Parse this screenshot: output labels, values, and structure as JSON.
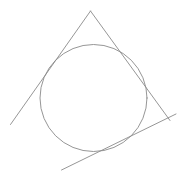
{
  "document": {
    "kind": "geometry-figure",
    "title": "Circle with three tangent lines forming a triangle",
    "background_color": "#ffffff",
    "width": 183,
    "height": 175
  },
  "figure": {
    "stroke_color": "#8a8a8a",
    "stroke_color_light": "#a6a6a6",
    "stroke_width": 0.9,
    "shapes": [
      {
        "id": "circle",
        "name": "inscribed-circle",
        "type": "circle",
        "cx": 93.5,
        "cy": 98.0,
        "r": 53.5,
        "stroke": "#8a8a8a",
        "stroke_width": 0.9
      },
      {
        "id": "line-left",
        "name": "tangent-line-left",
        "type": "line",
        "x1": 90.5,
        "y1": 11.0,
        "x2": 10.5,
        "y2": 124.5,
        "stroke": "#8a8a8a",
        "stroke_width": 0.9
      },
      {
        "id": "line-right",
        "name": "tangent-line-right",
        "type": "line",
        "x1": 90.5,
        "y1": 11.0,
        "x2": 170.0,
        "y2": 120.5,
        "stroke": "#8a8a8a",
        "stroke_width": 0.9
      },
      {
        "id": "line-base",
        "name": "tangent-line-base",
        "type": "line",
        "x1": 61.5,
        "y1": 170.0,
        "x2": 176.0,
        "y2": 114.0,
        "stroke": "#8a8a8a",
        "stroke_width": 0.9
      }
    ],
    "vertices": [
      {
        "id": "apex",
        "name": "triangle-apex-vertex",
        "x": 90.5,
        "y": 11.0
      },
      {
        "id": "left-end",
        "name": "left-line-endpoint",
        "x": 10.5,
        "y": 124.5
      },
      {
        "id": "right-vertex",
        "name": "triangle-right-vertex",
        "x": 170.0,
        "y": 120.5
      },
      {
        "id": "base-end",
        "name": "base-line-lower-endpoint",
        "x": 61.5,
        "y": 170.0
      }
    ]
  }
}
